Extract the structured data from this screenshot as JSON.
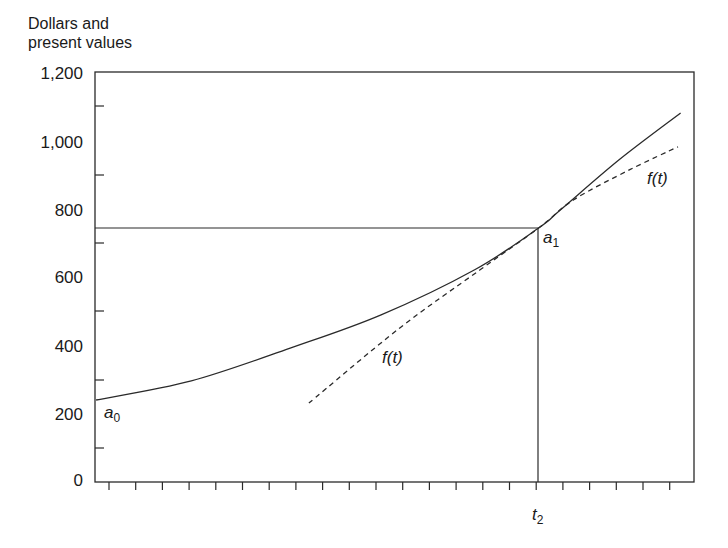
{
  "chart_data": {
    "type": "line",
    "title": "",
    "xlabel": "",
    "ylabel": "Dollars and present values",
    "ylabel_lines": [
      "Dollars and",
      "present values"
    ],
    "ylim": [
      0,
      1200
    ],
    "yticks": [
      0,
      200,
      400,
      600,
      800,
      1000,
      1200
    ],
    "ytick_labels": [
      "0",
      "200",
      "400",
      "600",
      "800",
      "1,000",
      "1,200"
    ],
    "yminor_ticks": [
      100,
      300,
      500,
      700,
      900,
      1100
    ],
    "xlim": [
      0,
      22.4
    ],
    "xticks_count": 22,
    "xtick_labels_shown": [
      {
        "x": 16.6,
        "label": "t2"
      }
    ],
    "grid": false,
    "series": [
      {
        "name": "present value curve",
        "style": "solid",
        "x": [
          0.04,
          3.6,
          7.3,
          10.7,
          14.2,
          16.6,
          17.4,
          19.6,
          21.9
        ],
        "y": [
          240,
          296,
          392,
          489,
          621,
          744,
          796,
          943,
          1080
        ]
      },
      {
        "name": "f(t)",
        "style": "dashed",
        "x": [
          8.0,
          11.4,
          14.4,
          16.6,
          17.9,
          20.0,
          21.8
        ],
        "y": [
          231,
          451,
          621,
          744,
          826,
          914,
          981
        ]
      }
    ],
    "reference_lines": [
      {
        "type": "horizontal",
        "y": 744,
        "x_from": 0,
        "x_to": 16.6
      },
      {
        "type": "vertical",
        "x": 16.6,
        "y_from": 0,
        "y_to": 744
      }
    ],
    "annotations": [
      {
        "text": "a0",
        "base": "a",
        "sub": "0",
        "x": 0.4,
        "y": 200
      },
      {
        "text": "a1",
        "base": "a",
        "sub": "1",
        "x": 16.8,
        "y": 710
      },
      {
        "text": "f(t)",
        "x": 10.7,
        "y": 365
      },
      {
        "text": "f(t)",
        "x": 20.7,
        "y": 890
      }
    ]
  },
  "labels": {
    "y_title_1": "Dollars and",
    "y_title_2": "present values",
    "y0": "0",
    "y200": "200",
    "y400": "400",
    "y600": "600",
    "y800": "800",
    "y1000": "1,000",
    "y1200": "1,200",
    "a0_base": "a",
    "a0_sub": "0",
    "a1_base": "a",
    "a1_sub": "1",
    "f_lower": "f(t)",
    "f_upper": "f(t)",
    "t2_base": "t",
    "t2_sub": "2"
  }
}
